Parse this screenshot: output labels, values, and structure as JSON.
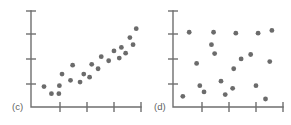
{
  "figure": {
    "background_color": "#ffffff",
    "axis_color": "#6f6f6f",
    "marker_color": "#6b6b6b",
    "marker_radius": 2.4
  },
  "chart_data": [
    {
      "type": "scatter",
      "label": "(c)",
      "title": "",
      "xlabel": "",
      "ylabel": "",
      "xlim": [
        0,
        10
      ],
      "ylim": [
        0,
        10
      ],
      "grid": false,
      "legend": "none",
      "xticks": [
        2.5,
        5.0,
        7.5,
        10.0
      ],
      "yticks": [
        2.5,
        5.0,
        7.5,
        10.0
      ],
      "xticklabels": [
        "",
        "",
        "",
        ""
      ],
      "yticklabels": [
        "",
        "",
        "",
        ""
      ],
      "description": "strong positive linear association",
      "points": [
        {
          "x": 0.85,
          "y": 1.85
        },
        {
          "x": 1.55,
          "y": 1.05
        },
        {
          "x": 2.25,
          "y": 1.05
        },
        {
          "x": 2.3,
          "y": 1.95
        },
        {
          "x": 2.55,
          "y": 3.25
        },
        {
          "x": 3.35,
          "y": 2.55
        },
        {
          "x": 3.55,
          "y": 4.25
        },
        {
          "x": 4.25,
          "y": 2.35
        },
        {
          "x": 4.6,
          "y": 3.25
        },
        {
          "x": 5.15,
          "y": 2.9
        },
        {
          "x": 5.35,
          "y": 4.35
        },
        {
          "x": 5.95,
          "y": 3.85
        },
        {
          "x": 6.25,
          "y": 5.2
        },
        {
          "x": 6.95,
          "y": 4.75
        },
        {
          "x": 7.45,
          "y": 5.85
        },
        {
          "x": 7.95,
          "y": 5.05
        },
        {
          "x": 8.15,
          "y": 6.25
        },
        {
          "x": 8.55,
          "y": 5.6
        },
        {
          "x": 8.95,
          "y": 7.35
        },
        {
          "x": 9.25,
          "y": 6.55
        },
        {
          "x": 9.55,
          "y": 8.35
        }
      ]
    },
    {
      "type": "scatter",
      "label": "(d)",
      "title": "",
      "xlabel": "",
      "ylabel": "",
      "xlim": [
        0,
        10
      ],
      "ylim": [
        0,
        10
      ],
      "grid": false,
      "legend": "none",
      "xticks": [
        2.5,
        5.0,
        7.5,
        10.0
      ],
      "yticks": [
        2.5,
        5.0,
        7.5,
        10.0
      ],
      "xticklabels": [
        "",
        "",
        "",
        ""
      ],
      "yticklabels": [
        "",
        "",
        "",
        ""
      ],
      "description": "no association / random scatter",
      "points": [
        {
          "x": 0.55,
          "y": 0.75
        },
        {
          "x": 1.15,
          "y": 7.95
        },
        {
          "x": 1.85,
          "y": 4.45
        },
        {
          "x": 2.15,
          "y": 1.95
        },
        {
          "x": 2.55,
          "y": 1.25
        },
        {
          "x": 3.25,
          "y": 6.55
        },
        {
          "x": 3.45,
          "y": 7.95
        },
        {
          "x": 3.55,
          "y": 5.55
        },
        {
          "x": 4.15,
          "y": 2.45
        },
        {
          "x": 4.55,
          "y": 0.95
        },
        {
          "x": 5.25,
          "y": 1.65
        },
        {
          "x": 5.35,
          "y": 3.85
        },
        {
          "x": 5.55,
          "y": 7.85
        },
        {
          "x": 6.05,
          "y": 4.95
        },
        {
          "x": 6.95,
          "y": 5.45
        },
        {
          "x": 7.45,
          "y": 1.95
        },
        {
          "x": 7.65,
          "y": 7.85
        },
        {
          "x": 8.35,
          "y": 0.45
        },
        {
          "x": 8.75,
          "y": 4.65
        },
        {
          "x": 8.95,
          "y": 8.15
        }
      ]
    }
  ]
}
